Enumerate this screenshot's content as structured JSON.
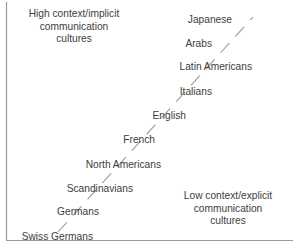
{
  "diagram": {
    "background_color": "#ffffff",
    "text_color": "#3d3d3d",
    "line_color": "#8d8d8d",
    "frame_color": "#9a9a9a",
    "notes": {
      "high_context": "High context/implicit\ncommunication\ncultures",
      "low_context": "Low context/explicit\ncommunication\ncultures"
    },
    "axis": {
      "left_rule": "vertical",
      "bottom_rule": "horizontal",
      "right_rule": "none",
      "top_rule": "none"
    },
    "continuum": {
      "style": "dashed",
      "direction": "lower-left to upper-right",
      "start": {
        "x": 58,
        "y": 232
      },
      "end": {
        "x": 253,
        "y": 17
      }
    },
    "cultures": [
      {
        "label": "Japanese",
        "x": 232,
        "y": 14,
        "anchor": "end",
        "rank": 1
      },
      {
        "label": "Arabs",
        "x": 212,
        "y": 38,
        "anchor": "end",
        "rank": 2
      },
      {
        "label": "Latin Americans",
        "x": 252,
        "y": 61,
        "anchor": "end",
        "rank": 3
      },
      {
        "label": "Italians",
        "x": 212,
        "y": 86,
        "anchor": "end",
        "rank": 4
      },
      {
        "label": "Italians_dup",
        "x": 0,
        "y": 0,
        "anchor": "end",
        "rank": 0
      },
      {
        "label": "English",
        "x": 186,
        "y": 110,
        "anchor": "end",
        "rank": 5
      },
      {
        "label": "French",
        "x": 155,
        "y": 134,
        "anchor": "end",
        "rank": 6
      },
      {
        "label": "North Americans",
        "x": 161,
        "y": 159,
        "anchor": "end",
        "rank": 7
      },
      {
        "label": "Scandinavians",
        "x": 133,
        "y": 183,
        "anchor": "end",
        "rank": 8
      },
      {
        "label": "Germans",
        "x": 99,
        "y": 206,
        "anchor": "end",
        "rank": 9
      },
      {
        "label": "Swiss Germans",
        "x": 93,
        "y": 231,
        "anchor": "end",
        "rank": 10
      }
    ]
  }
}
